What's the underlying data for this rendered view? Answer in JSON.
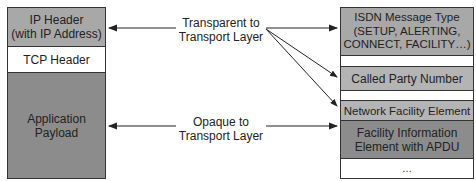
{
  "left_stack": {
    "ip_header": {
      "line1": "IP Header",
      "line2": "(with IP Address)",
      "color": "#a8a8a8"
    },
    "tcp_header": {
      "label": "TCP Header",
      "color": "#ffffff"
    },
    "payload": {
      "line1": "Application",
      "line2": "Payload",
      "color": "#8c8c8c"
    }
  },
  "middle": {
    "transparent": {
      "line1": "Transparent to",
      "line2": "Transport Layer"
    },
    "opaque": {
      "line1": "Opaque to",
      "line2": "Transport Layer"
    }
  },
  "right_stack": {
    "message_type": {
      "line1": "ISDN Message Type",
      "line2": "(SETUP, ALERTING,",
      "line3": "CONNECT, FACILITY…)",
      "color": "#a8a8a8"
    },
    "called_party": {
      "label": "Called Party Number",
      "color": "#b4b4b4"
    },
    "network_facility": {
      "label": "Network Facility Element",
      "color": "#b4b4b4"
    },
    "facility_info": {
      "line1": "Facility Information",
      "line2": "Element with APDU",
      "color": "#8c8c8c"
    },
    "ellipsis": {
      "label": "…"
    }
  }
}
